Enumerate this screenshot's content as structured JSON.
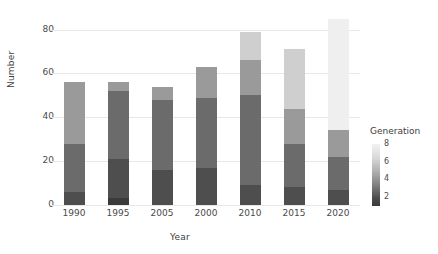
{
  "chart_data": {
    "type": "bar",
    "stacked": true,
    "title": "",
    "xlabel": "Year",
    "ylabel": "Number",
    "categories": [
      "1990",
      "1995",
      "2005",
      "2000",
      "2010",
      "2015",
      "2020"
    ],
    "ylim": [
      0,
      88
    ],
    "yticks": [
      0,
      20,
      40,
      60,
      80
    ],
    "grid": true,
    "legend": {
      "title": "Generation",
      "type": "continuous-colorbar",
      "position": "right",
      "ticks": [
        2,
        4,
        6,
        8
      ],
      "tick_labels": [
        "2",
        "4",
        "6",
        "8"
      ],
      "vmin": 1,
      "vmax": 8,
      "colors_low_to_high": [
        "#3a3a3a",
        "#4e4e4e",
        "#636363",
        "#7d7d7d",
        "#9a9a9a",
        "#b8b8b8",
        "#dcdcdc",
        "#f2f2f2"
      ]
    },
    "series": [
      {
        "name": "1",
        "generation": 1,
        "color": "#3a3a3a",
        "values": [
          0,
          3,
          0,
          0,
          0,
          0,
          0
        ]
      },
      {
        "name": "2",
        "generation": 2,
        "color": "#4e4e4e",
        "values": [
          6,
          18,
          16,
          17,
          9,
          8,
          7
        ]
      },
      {
        "name": "3",
        "generation": 3,
        "color": "#6b6b6b",
        "values": [
          22,
          31,
          32,
          32,
          41,
          20,
          15
        ]
      },
      {
        "name": "4",
        "generation": 4,
        "color": "#9a9a9a",
        "values": [
          28,
          4,
          6,
          14,
          16,
          16,
          12
        ]
      },
      {
        "name": "5",
        "generation": 5,
        "color": "#cfcfcf",
        "values": [
          0,
          0,
          0,
          0,
          13,
          27,
          0
        ]
      },
      {
        "name": "6",
        "generation": 6,
        "color": "#efefef",
        "values": [
          0,
          0,
          0,
          0,
          0,
          0,
          51
        ]
      }
    ],
    "bar_totals": [
      56,
      56,
      54,
      63,
      79,
      71,
      85
    ]
  },
  "axes": {
    "y_tick_labels": [
      "0",
      "20",
      "40",
      "60",
      "80"
    ],
    "x_tick_labels": [
      "1990",
      "1995",
      "2005",
      "2000",
      "2010",
      "2015",
      "2020"
    ]
  }
}
